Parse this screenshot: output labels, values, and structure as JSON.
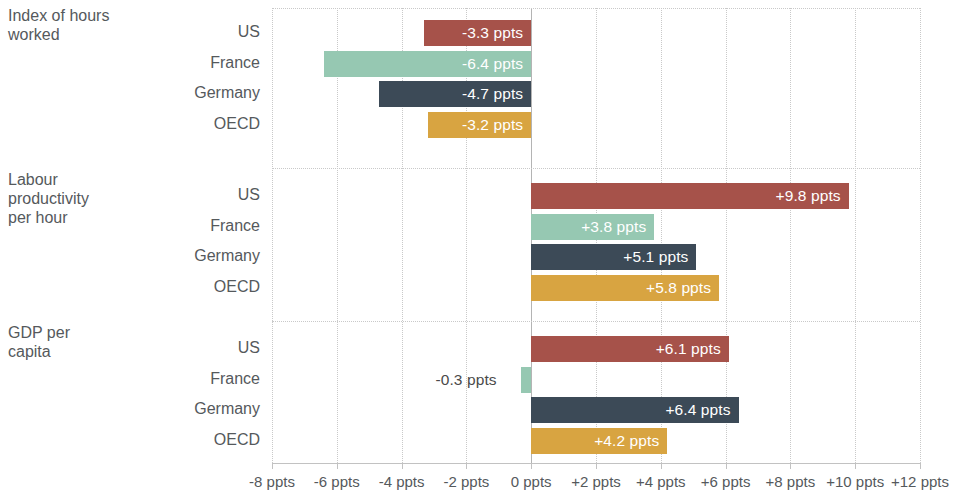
{
  "chart_data": {
    "type": "bar",
    "orientation": "horizontal",
    "title": "",
    "xlabel": "",
    "ylabel": "",
    "xlim": [
      -8,
      12
    ],
    "grid": true,
    "legend": false,
    "unit": "ppts",
    "categories": [
      "US",
      "France",
      "Germany",
      "OECD"
    ],
    "colors": {
      "US": "#A6524A",
      "France": "#96C8B2",
      "Germany": "#3C4A57",
      "OECD": "#D8A441"
    },
    "x_ticks": [
      -8,
      -6,
      -4,
      -2,
      0,
      2,
      4,
      6,
      8,
      10,
      12
    ],
    "x_tick_labels": [
      "-8 ppts",
      "-6 ppts",
      "-4 ppts",
      "-2 ppts",
      "0 ppts",
      "+2 ppts",
      "+4 ppts",
      "+6 ppts",
      "+8 ppts",
      "+10 ppts",
      "+12 ppts"
    ],
    "groups": [
      {
        "title": "Index of hours worked",
        "title_lines": [
          "Index of hours",
          "worked"
        ],
        "bars": [
          {
            "category": "US",
            "value": -3.3,
            "label": "-3.3 ppts",
            "label_inside": true
          },
          {
            "category": "France",
            "value": -6.4,
            "label": "-6.4 ppts",
            "label_inside": true
          },
          {
            "category": "Germany",
            "value": -4.7,
            "label": "-4.7 ppts",
            "label_inside": true
          },
          {
            "category": "OECD",
            "value": -3.2,
            "label": "-3.2 ppts",
            "label_inside": true
          }
        ]
      },
      {
        "title": "Labour productivity per hour",
        "title_lines": [
          "Labour",
          "productivity",
          "per hour"
        ],
        "bars": [
          {
            "category": "US",
            "value": 9.8,
            "label": "+9.8 ppts",
            "label_inside": true
          },
          {
            "category": "France",
            "value": 3.8,
            "label": "+3.8 ppts",
            "label_inside": true
          },
          {
            "category": "Germany",
            "value": 5.1,
            "label": "+5.1 ppts",
            "label_inside": true
          },
          {
            "category": "OECD",
            "value": 5.8,
            "label": "+5.8 ppts",
            "label_inside": true
          }
        ]
      },
      {
        "title": "GDP per capita",
        "title_lines": [
          "GDP per",
          "capita"
        ],
        "bars": [
          {
            "category": "US",
            "value": 6.1,
            "label": "+6.1 ppts",
            "label_inside": true
          },
          {
            "category": "France",
            "value": -0.3,
            "label": "-0.3 ppts",
            "label_inside": false
          },
          {
            "category": "Germany",
            "value": 6.4,
            "label": "+6.4 ppts",
            "label_inside": true
          },
          {
            "category": "OECD",
            "value": 4.2,
            "label": "+4.2 ppts",
            "label_inside": true
          }
        ]
      }
    ]
  }
}
